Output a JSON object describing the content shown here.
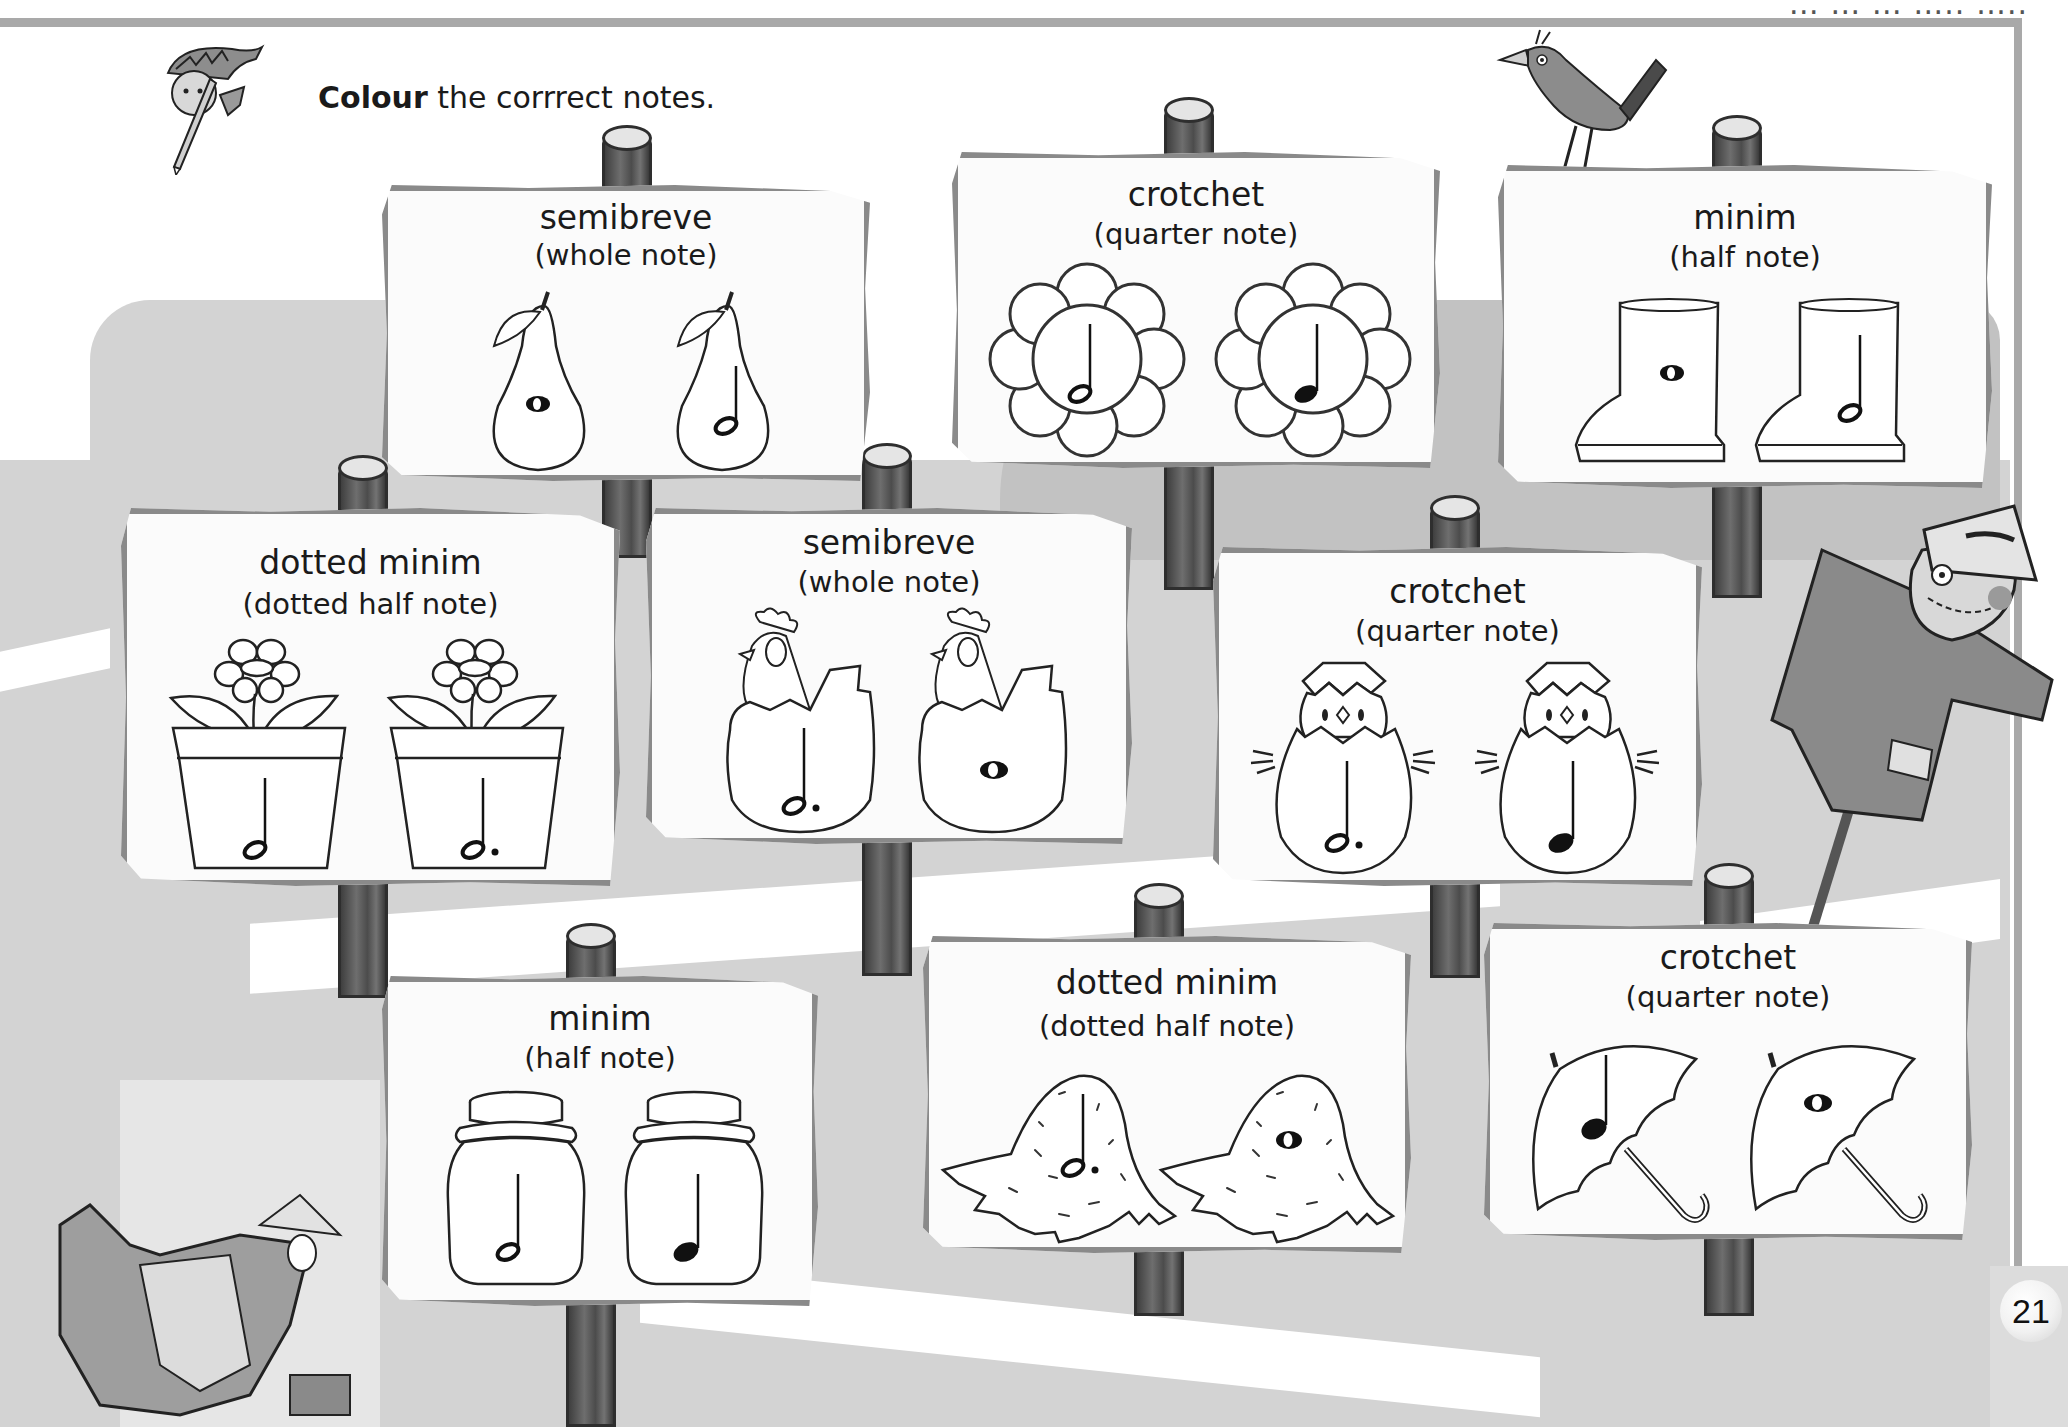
{
  "header": {
    "cut_text": "… … … ….. ….."
  },
  "instruction": {
    "bold": "Colour",
    "rest": " the corrrect notes."
  },
  "page_number": "21",
  "signs": [
    {
      "title": "semibreve",
      "subtitle": "(whole note)",
      "object": "pear",
      "items": [
        {
          "note": "semibreve"
        },
        {
          "note": "minim"
        }
      ]
    },
    {
      "title": "crotchet",
      "subtitle": "(quarter note)",
      "object": "flower",
      "items": [
        {
          "note": "minim"
        },
        {
          "note": "crotchet"
        }
      ]
    },
    {
      "title": "minim",
      "subtitle": "(half note)",
      "object": "boot",
      "items": [
        {
          "note": "semibreve"
        },
        {
          "note": "minim"
        }
      ]
    },
    {
      "title": "dotted minim",
      "subtitle": "(dotted half note)",
      "object": "flowerpot",
      "items": [
        {
          "note": "minim"
        },
        {
          "note": "dotted-minim"
        }
      ]
    },
    {
      "title": "semibreve",
      "subtitle": "(whole note)",
      "object": "hen",
      "items": [
        {
          "note": "dotted-minim"
        },
        {
          "note": "semibreve"
        }
      ]
    },
    {
      "title": "crotchet",
      "subtitle": "(quarter note)",
      "object": "chick",
      "items": [
        {
          "note": "dotted-minim"
        },
        {
          "note": "crotchet"
        }
      ]
    },
    {
      "title": "minim",
      "subtitle": "(half note)",
      "object": "jar",
      "items": [
        {
          "note": "minim"
        },
        {
          "note": "crotchet"
        }
      ]
    },
    {
      "title": "dotted minim",
      "subtitle": "(dotted half note)",
      "object": "straw-hat",
      "items": [
        {
          "note": "dotted-minim"
        },
        {
          "note": "semibreve"
        }
      ]
    },
    {
      "title": "crotchet",
      "subtitle": "(quarter note)",
      "object": "umbrella",
      "items": [
        {
          "note": "crotchet"
        },
        {
          "note": "semibreve"
        }
      ]
    }
  ],
  "colors": {
    "sign_border": "#8a8a8a",
    "sign_fill": "#fbfbfb",
    "field_mid": "#d3d3d3",
    "field_dark": "#c2c2c2",
    "rule": "#a9a9a9",
    "ink": "#1a1a1a"
  }
}
